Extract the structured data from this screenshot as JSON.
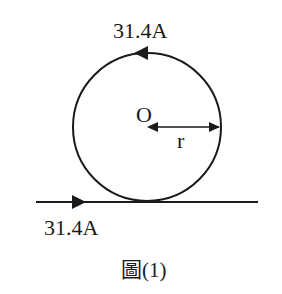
{
  "diagram": {
    "type": "physics-magnetism",
    "circle_loop": {
      "current_label": "31.4A",
      "current_direction": "counterclockwise",
      "center_label": "O",
      "radius_label": "r"
    },
    "straight_wire": {
      "current_label": "31.4A",
      "current_direction": "right"
    },
    "caption": "圖(1)"
  },
  "colors": {
    "stroke": "#1a1a1a",
    "background": "#ffffff"
  }
}
